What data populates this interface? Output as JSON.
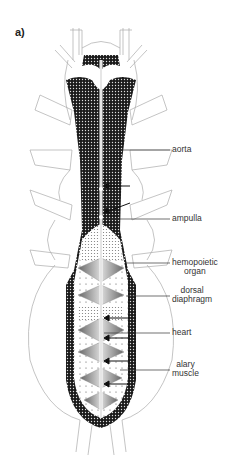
{
  "figure": {
    "panel_label": "a)",
    "labels": [
      {
        "id": "aorta",
        "text": "aorta"
      },
      {
        "id": "ampulla",
        "text": "ampulla"
      },
      {
        "id": "hemopoietic-organ",
        "line1": "hemopoietic",
        "line2": "organ"
      },
      {
        "id": "dorsal-diaphragm",
        "line1": "dorsal",
        "line2": "diaphragm"
      },
      {
        "id": "heart",
        "text": "heart"
      },
      {
        "id": "alary-muscle",
        "line1": "alary",
        "line2": "muscle"
      }
    ]
  }
}
